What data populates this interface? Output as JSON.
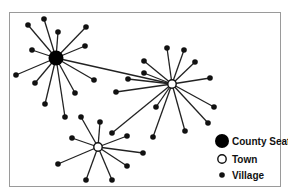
{
  "diagram": {
    "type": "central-place hierarchy network",
    "nodes": [
      {
        "id": "seat",
        "kind": "county_seat",
        "x": 56,
        "y": 58
      },
      {
        "id": "town1",
        "kind": "town",
        "x": 172,
        "y": 84
      },
      {
        "id": "town2",
        "kind": "town",
        "x": 98,
        "y": 147
      },
      {
        "id": "v1",
        "kind": "village",
        "x": 28,
        "y": 25,
        "parent": "seat"
      },
      {
        "id": "v2",
        "kind": "village",
        "x": 44,
        "y": 19,
        "parent": "seat"
      },
      {
        "id": "v3",
        "kind": "village",
        "x": 58,
        "y": 32,
        "parent": "seat"
      },
      {
        "id": "v4",
        "kind": "village",
        "x": 86,
        "y": 27,
        "parent": "seat"
      },
      {
        "id": "v5",
        "kind": "village",
        "x": 32,
        "y": 50,
        "parent": "seat"
      },
      {
        "id": "v6",
        "kind": "village",
        "x": 85,
        "y": 46,
        "parent": "seat"
      },
      {
        "id": "v7",
        "kind": "village",
        "x": 16,
        "y": 75,
        "parent": "seat"
      },
      {
        "id": "v8",
        "kind": "village",
        "x": 35,
        "y": 83,
        "parent": "seat"
      },
      {
        "id": "v9",
        "kind": "village",
        "x": 94,
        "y": 80,
        "parent": "seat"
      },
      {
        "id": "v10",
        "kind": "village",
        "x": 75,
        "y": 93,
        "parent": "seat"
      },
      {
        "id": "v11",
        "kind": "village",
        "x": 45,
        "y": 104,
        "parent": "seat"
      },
      {
        "id": "v12",
        "kind": "village",
        "x": 65,
        "y": 117,
        "parent": "seat"
      },
      {
        "id": "v13",
        "kind": "village",
        "x": 167,
        "y": 48,
        "parent": "town1"
      },
      {
        "id": "v14",
        "kind": "village",
        "x": 184,
        "y": 50,
        "parent": "town1"
      },
      {
        "id": "v15",
        "kind": "village",
        "x": 144,
        "y": 61,
        "parent": "town1"
      },
      {
        "id": "v16",
        "kind": "village",
        "x": 195,
        "y": 62,
        "parent": "town1"
      },
      {
        "id": "v17",
        "kind": "village",
        "x": 144,
        "y": 73,
        "parent": "town1"
      },
      {
        "id": "v18",
        "kind": "village",
        "x": 128,
        "y": 79,
        "parent": "town1"
      },
      {
        "id": "v19",
        "kind": "village",
        "x": 210,
        "y": 78,
        "parent": "town1"
      },
      {
        "id": "v20",
        "kind": "village",
        "x": 116,
        "y": 92,
        "parent": "town1"
      },
      {
        "id": "v21",
        "kind": "village",
        "x": 214,
        "y": 107,
        "parent": "town1"
      },
      {
        "id": "v22",
        "kind": "village",
        "x": 156,
        "y": 107,
        "parent": "town1"
      },
      {
        "id": "v23",
        "kind": "village",
        "x": 208,
        "y": 123,
        "parent": "town1"
      },
      {
        "id": "v24",
        "kind": "village",
        "x": 185,
        "y": 131,
        "parent": "town1"
      },
      {
        "id": "v25",
        "kind": "village",
        "x": 153,
        "y": 137,
        "parent": "town1"
      },
      {
        "id": "v26",
        "kind": "village",
        "x": 112,
        "y": 133,
        "parent": "town1"
      },
      {
        "id": "v27",
        "kind": "village",
        "x": 81,
        "y": 117,
        "parent": "town2"
      },
      {
        "id": "v28",
        "kind": "village",
        "x": 100,
        "y": 122,
        "parent": "town2"
      },
      {
        "id": "v29",
        "kind": "village",
        "x": 72,
        "y": 138,
        "parent": "town2"
      },
      {
        "id": "v30",
        "kind": "village",
        "x": 127,
        "y": 136,
        "parent": "town2"
      },
      {
        "id": "v31",
        "kind": "village",
        "x": 143,
        "y": 153,
        "parent": "town2"
      },
      {
        "id": "v32",
        "kind": "village",
        "x": 58,
        "y": 164,
        "parent": "town2"
      },
      {
        "id": "v33",
        "kind": "village",
        "x": 127,
        "y": 166,
        "parent": "town2"
      },
      {
        "id": "v34",
        "kind": "village",
        "x": 86,
        "y": 180,
        "parent": "town2"
      },
      {
        "id": "v35",
        "kind": "village",
        "x": 112,
        "y": 180,
        "parent": "town2"
      }
    ],
    "extra_links": [
      {
        "from": "seat",
        "to": "town1"
      }
    ]
  },
  "legend": {
    "items": [
      {
        "kind": "county_seat",
        "label": "County Seat"
      },
      {
        "kind": "town",
        "label": "Town"
      },
      {
        "kind": "village",
        "label": "Village"
      }
    ]
  }
}
